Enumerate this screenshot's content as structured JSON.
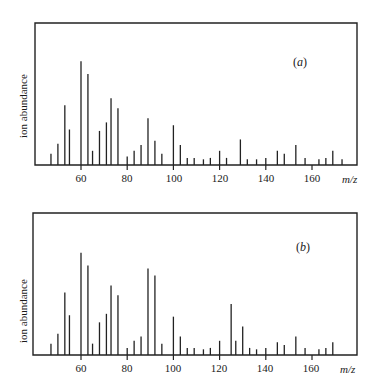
{
  "chart_data": [
    {
      "type": "bar",
      "title": "(a)",
      "panel_letter": "a",
      "xlabel": "m/z",
      "ylabel": "ion abundance",
      "xlim": [
        40,
        176
      ],
      "xticks": [
        60,
        80,
        100,
        120,
        140,
        160
      ],
      "ylim": [
        0,
        100
      ],
      "grid": false,
      "x": [
        47,
        50,
        53,
        55,
        60,
        63,
        65,
        68,
        71,
        73,
        76,
        80,
        83,
        86,
        89,
        92,
        95,
        100,
        103,
        106,
        109,
        113,
        116,
        120,
        123,
        129,
        132,
        136,
        140,
        145,
        148,
        153,
        157,
        163,
        166,
        169,
        173
      ],
      "values": [
        8,
        15,
        42,
        25,
        73,
        64,
        10,
        24,
        30,
        47,
        40,
        6,
        10,
        14,
        33,
        17,
        8,
        28,
        14,
        5,
        5,
        4,
        5,
        10,
        5,
        18,
        4,
        4,
        5,
        10,
        8,
        14,
        5,
        4,
        5,
        10,
        4
      ]
    },
    {
      "type": "bar",
      "title": "(b)",
      "panel_letter": "b",
      "xlabel": "m/z",
      "ylabel": "ion abundance",
      "xlim": [
        40,
        176
      ],
      "xticks": [
        60,
        80,
        100,
        120,
        140,
        160
      ],
      "ylim": [
        0,
        100
      ],
      "grid": false,
      "x": [
        47,
        50,
        53,
        55,
        60,
        63,
        65,
        68,
        71,
        73,
        76,
        80,
        83,
        86,
        89,
        92,
        95,
        100,
        103,
        106,
        109,
        113,
        116,
        120,
        125,
        127,
        130,
        133,
        136,
        140,
        145,
        148,
        153,
        157,
        163,
        166,
        169
      ],
      "values": [
        8,
        15,
        44,
        28,
        72,
        63,
        8,
        23,
        29,
        49,
        42,
        5,
        10,
        13,
        61,
        56,
        8,
        27,
        13,
        5,
        5,
        4,
        5,
        10,
        36,
        10,
        20,
        5,
        4,
        5,
        9,
        7,
        13,
        5,
        4,
        5,
        9
      ]
    }
  ],
  "panels": [
    {
      "ylabel": "ion abundance",
      "xlabel": "m/z",
      "label_open": "(",
      "label_letter": "a",
      "label_close": ")",
      "ticks": [
        "60",
        "80",
        "100",
        "120",
        "140",
        "160"
      ]
    },
    {
      "ylabel": "ion abundance",
      "xlabel": "m/z",
      "label_open": "(",
      "label_letter": "b",
      "label_close": ")",
      "ticks": [
        "60",
        "80",
        "100",
        "120",
        "140",
        "160"
      ]
    }
  ]
}
